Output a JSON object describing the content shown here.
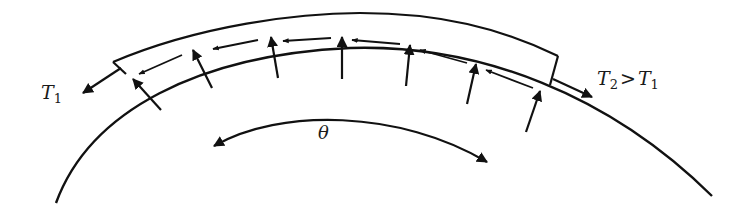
{
  "diagram": {
    "type": "belt-friction",
    "colors": {
      "line": "#111111",
      "background": "#ffffff"
    },
    "labels": {
      "t1": {
        "symbol": "T",
        "subscript": "1"
      },
      "t2": {
        "symbol": "T",
        "subscript": "2",
        "relation": ">",
        "rhs_symbol": "T",
        "rhs_subscript": "1"
      },
      "theta": "θ"
    },
    "normal_force_count": 8,
    "friction_arrow_count": 8
  }
}
